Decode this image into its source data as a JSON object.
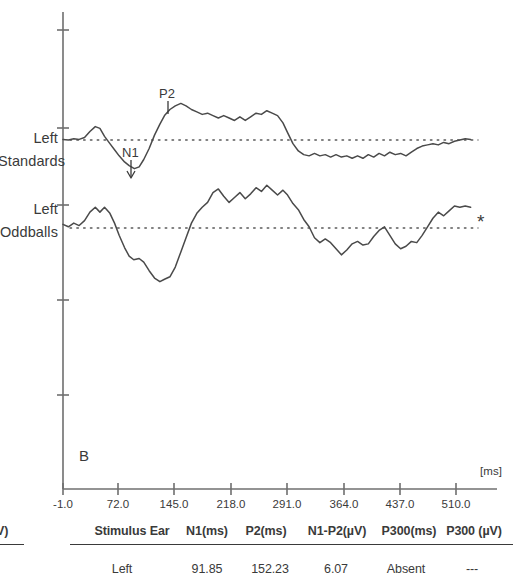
{
  "figure": {
    "panel_letter": "B",
    "x_unit_label": "[ms]",
    "significance_marker": "*",
    "traces": [
      {
        "line1": "Left",
        "line2": "Standards"
      },
      {
        "line1": "Left",
        "line2": "Oddballs"
      }
    ],
    "peak_labels": [
      {
        "name": "N1"
      },
      {
        "name": "P2"
      }
    ]
  },
  "chart_data": {
    "type": "line",
    "title": "B",
    "xlabel": "[ms]",
    "ylabel": "",
    "xlim": [
      -1.0,
      529.0
    ],
    "xticks": [
      -1.0,
      72.0,
      145.0,
      218.0,
      291.0,
      364.0,
      437.0,
      510.0
    ],
    "xticklabels": [
      "-1.0",
      "72.0",
      "145.0",
      "218.0",
      "291.0",
      "364.0",
      "437.0",
      "510.0"
    ],
    "grid": false,
    "legend": "none",
    "annotations": [
      {
        "text": "N1",
        "x": 91.85,
        "series": "Left Standards"
      },
      {
        "text": "P2",
        "x": 152.23,
        "series": "Left Standards"
      },
      {
        "text": "*",
        "x": 529.0,
        "series": "Left Oddballs"
      }
    ],
    "series": [
      {
        "name": "Left Standards",
        "baseline": 0,
        "points": [
          [
            -1.0,
            0.1
          ],
          [
            6.0,
            0.0
          ],
          [
            13.0,
            0.2
          ],
          [
            20.0,
            0.1
          ],
          [
            27.0,
            0.4
          ],
          [
            34.0,
            1.4
          ],
          [
            41.0,
            2.2
          ],
          [
            47.0,
            1.9
          ],
          [
            53.0,
            0.6
          ],
          [
            60.0,
            -0.6
          ],
          [
            66.0,
            -1.6
          ],
          [
            72.0,
            -2.6
          ],
          [
            79.0,
            -3.6
          ],
          [
            85.0,
            -4.2
          ],
          [
            91.85,
            -4.7
          ],
          [
            98.0,
            -4.4
          ],
          [
            104.0,
            -3.2
          ],
          [
            111.0,
            -1.4
          ],
          [
            118.0,
            0.8
          ],
          [
            125.0,
            2.6
          ],
          [
            131.0,
            4.0
          ],
          [
            138.0,
            5.0
          ],
          [
            145.0,
            5.6
          ],
          [
            152.23,
            6.0
          ],
          [
            159.0,
            5.6
          ],
          [
            166.0,
            5.0
          ],
          [
            173.0,
            4.6
          ],
          [
            180.0,
            4.2
          ],
          [
            187.0,
            4.4
          ],
          [
            194.0,
            4.0
          ],
          [
            201.0,
            3.6
          ],
          [
            208.0,
            4.0
          ],
          [
            215.0,
            3.6
          ],
          [
            222.0,
            3.2
          ],
          [
            229.0,
            3.8
          ],
          [
            236.0,
            3.2
          ],
          [
            243.0,
            3.8
          ],
          [
            250.0,
            4.4
          ],
          [
            257.0,
            4.2
          ],
          [
            264.0,
            4.8
          ],
          [
            271.0,
            4.4
          ],
          [
            278.0,
            4.0
          ],
          [
            285.0,
            2.8
          ],
          [
            291.0,
            1.2
          ],
          [
            298.0,
            -0.6
          ],
          [
            305.0,
            -1.8
          ],
          [
            312.0,
            -2.4
          ],
          [
            319.0,
            -2.6
          ],
          [
            326.0,
            -2.2
          ],
          [
            333.0,
            -2.6
          ],
          [
            340.0,
            -2.4
          ],
          [
            347.0,
            -2.8
          ],
          [
            354.0,
            -2.4
          ],
          [
            361.0,
            -2.8
          ],
          [
            368.0,
            -2.6
          ],
          [
            375.0,
            -3.0
          ],
          [
            382.0,
            -2.6
          ],
          [
            389.0,
            -3.0
          ],
          [
            396.0,
            -2.4
          ],
          [
            403.0,
            -2.8
          ],
          [
            410.0,
            -2.2
          ],
          [
            417.0,
            -2.6
          ],
          [
            424.0,
            -2.0
          ],
          [
            431.0,
            -2.4
          ],
          [
            438.0,
            -2.2
          ],
          [
            445.0,
            -2.6
          ],
          [
            452.0,
            -2.0
          ],
          [
            459.0,
            -1.4
          ],
          [
            466.0,
            -1.0
          ],
          [
            473.0,
            -0.8
          ],
          [
            480.0,
            -0.6
          ],
          [
            487.0,
            -0.8
          ],
          [
            494.0,
            -0.4
          ],
          [
            501.0,
            -0.6
          ],
          [
            508.0,
            -0.2
          ],
          [
            515.0,
            0.0
          ],
          [
            522.0,
            0.2
          ],
          [
            529.0,
            0.1
          ]
        ]
      },
      {
        "name": "Left Oddballs",
        "baseline": 0,
        "points": [
          [
            -1.0,
            0.6
          ],
          [
            6.0,
            0.2
          ],
          [
            13.0,
            0.8
          ],
          [
            20.0,
            0.4
          ],
          [
            27.0,
            1.2
          ],
          [
            34.0,
            2.6
          ],
          [
            41.0,
            3.4
          ],
          [
            47.0,
            2.6
          ],
          [
            53.0,
            3.4
          ],
          [
            60.0,
            2.4
          ],
          [
            66.0,
            0.8
          ],
          [
            72.0,
            -1.2
          ],
          [
            79.0,
            -3.2
          ],
          [
            85.0,
            -4.6
          ],
          [
            91.0,
            -5.2
          ],
          [
            98.0,
            -5.0
          ],
          [
            104.0,
            -5.6
          ],
          [
            111.0,
            -7.0
          ],
          [
            118.0,
            -8.2
          ],
          [
            125.0,
            -8.8
          ],
          [
            131.0,
            -8.4
          ],
          [
            138.0,
            -8.0
          ],
          [
            145.0,
            -6.4
          ],
          [
            152.0,
            -4.0
          ],
          [
            159.0,
            -1.6
          ],
          [
            166.0,
            0.8
          ],
          [
            173.0,
            2.4
          ],
          [
            180.0,
            3.4
          ],
          [
            187.0,
            4.2
          ],
          [
            194.0,
            5.8
          ],
          [
            201.0,
            6.4
          ],
          [
            208.0,
            5.2
          ],
          [
            215.0,
            4.2
          ],
          [
            222.0,
            5.0
          ],
          [
            229.0,
            5.8
          ],
          [
            236.0,
            4.8
          ],
          [
            243.0,
            5.6
          ],
          [
            250.0,
            6.6
          ],
          [
            257.0,
            6.0
          ],
          [
            264.0,
            7.0
          ],
          [
            271.0,
            6.2
          ],
          [
            278.0,
            5.4
          ],
          [
            285.0,
            6.2
          ],
          [
            291.0,
            5.4
          ],
          [
            298.0,
            4.0
          ],
          [
            305.0,
            3.0
          ],
          [
            312.0,
            1.4
          ],
          [
            319.0,
            0.2
          ],
          [
            326.0,
            -1.6
          ],
          [
            333.0,
            -2.4
          ],
          [
            340.0,
            -1.8
          ],
          [
            347.0,
            -2.4
          ],
          [
            354.0,
            -3.4
          ],
          [
            361.0,
            -4.4
          ],
          [
            368.0,
            -3.6
          ],
          [
            375.0,
            -2.6
          ],
          [
            382.0,
            -2.2
          ],
          [
            389.0,
            -2.8
          ],
          [
            396.0,
            -2.6
          ],
          [
            403.0,
            -1.4
          ],
          [
            410.0,
            -0.4
          ],
          [
            417.0,
            0.2
          ],
          [
            424.0,
            -1.2
          ],
          [
            431.0,
            -2.6
          ],
          [
            438.0,
            -3.4
          ],
          [
            445.0,
            -3.0
          ],
          [
            452.0,
            -2.2
          ],
          [
            459.0,
            -2.4
          ],
          [
            466.0,
            -1.2
          ],
          [
            473.0,
            0.2
          ],
          [
            480.0,
            1.6
          ],
          [
            487.0,
            2.6
          ],
          [
            494.0,
            2.0
          ],
          [
            501.0,
            2.8
          ],
          [
            508.0,
            3.6
          ],
          [
            515.0,
            3.4
          ],
          [
            522.0,
            3.6
          ],
          [
            529.0,
            3.4
          ]
        ]
      }
    ]
  },
  "table": {
    "clipped_left_header": "V)",
    "headers": [
      "Stimulus Ear",
      "N1(ms)",
      "P2(ms)",
      "N1-P2(µV)",
      "P300(ms)",
      "P300 (µV)"
    ],
    "rows": [
      [
        "Left",
        "91.85",
        "152.23",
        "6.07",
        "Absent",
        "---"
      ]
    ]
  }
}
